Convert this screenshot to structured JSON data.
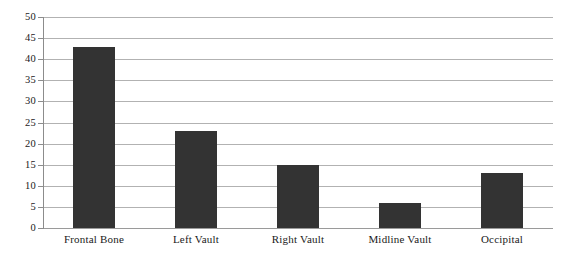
{
  "chart_data": {
    "type": "bar",
    "title": "",
    "subtitle": "",
    "xlabel": "",
    "ylabel": "",
    "categories": [
      "Frontal Bone",
      "Left Vault",
      "Right Vault",
      "Midline Vault",
      "Occipital"
    ],
    "values": [
      43,
      23,
      15,
      6,
      13
    ],
    "ylim": [
      0,
      50
    ],
    "y_ticks": [
      0,
      5,
      10,
      15,
      20,
      25,
      30,
      35,
      40,
      45,
      50
    ],
    "y_tick_labels": [
      "0",
      "5",
      "10",
      "15",
      "20",
      "25",
      "30",
      "35",
      "40",
      "45",
      "50"
    ],
    "grid": true,
    "grid_axis": "y",
    "legend": false,
    "legend_position": "none",
    "series": [
      {
        "name": "",
        "values": [
          43,
          23,
          15,
          6,
          13
        ]
      }
    ],
    "colors": {
      "bar_fill": "#333333",
      "gridline": "#b2b2b2",
      "axis_line": "#8c8c8c",
      "background": "#ffffff",
      "text": "#1a1a1a"
    }
  }
}
